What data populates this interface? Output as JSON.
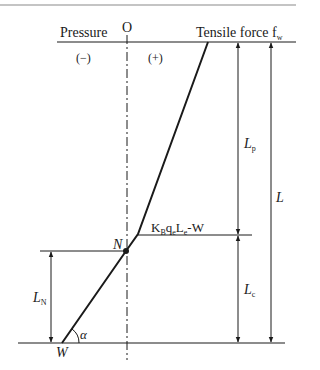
{
  "diagram": {
    "type": "force-distribution",
    "origin_label": "O",
    "left_header": "Pressure",
    "right_header_main": "Tensile force f",
    "right_header_sub": "w",
    "sign_negative": "(−)",
    "sign_positive": "(+)",
    "kink_label": {
      "K": "K",
      "K_sub": "B",
      "q": "q",
      "q_sub": "e",
      "L": "L",
      "L_sub": "e",
      "tail": "-W"
    },
    "point_N": "N",
    "point_W": "W",
    "angle": "α",
    "dimensions": {
      "Lp": {
        "main": "L",
        "sub": "p"
      },
      "Lc": {
        "main": "L",
        "sub": "c"
      },
      "L": {
        "main": "L"
      },
      "LN": {
        "main": "L",
        "sub": "N"
      }
    },
    "colors": {
      "line": "#1a1a1a",
      "border": "#777777"
    }
  }
}
